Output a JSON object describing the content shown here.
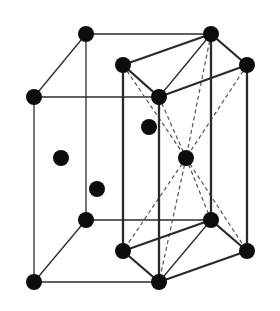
{
  "diagram": {
    "type": "crystal-unit-cell",
    "colors": {
      "background": "#ffffff",
      "line": "#2a2a2a",
      "atom": "#0d0d0d",
      "dashed": "#555555"
    },
    "atoms": [
      {
        "id": "a1",
        "x": 86,
        "y": 34
      },
      {
        "id": "a2",
        "x": 211,
        "y": 34
      },
      {
        "id": "a3",
        "x": 123,
        "y": 65
      },
      {
        "id": "a4",
        "x": 247,
        "y": 65
      },
      {
        "id": "a5",
        "x": 34,
        "y": 97
      },
      {
        "id": "a6",
        "x": 159,
        "y": 97
      },
      {
        "id": "a7",
        "x": 149,
        "y": 127
      },
      {
        "id": "a8",
        "x": 61,
        "y": 158
      },
      {
        "id": "a9",
        "x": 186,
        "y": 158
      },
      {
        "id": "a10",
        "x": 97,
        "y": 189
      },
      {
        "id": "a11",
        "x": 86,
        "y": 220
      },
      {
        "id": "a12",
        "x": 211,
        "y": 220
      },
      {
        "id": "a13",
        "x": 123,
        "y": 251
      },
      {
        "id": "a14",
        "x": 247,
        "y": 251
      },
      {
        "id": "a15",
        "x": 34,
        "y": 282
      },
      {
        "id": "a16",
        "x": 159,
        "y": 282
      }
    ],
    "thin_edges": [
      [
        86,
        34,
        211,
        34
      ],
      [
        34,
        97,
        86,
        34
      ],
      [
        34,
        97,
        159,
        97
      ],
      [
        34,
        97,
        34,
        282
      ],
      [
        86,
        34,
        86,
        220
      ],
      [
        86,
        220,
        211,
        220
      ],
      [
        34,
        282,
        86,
        220
      ],
      [
        34,
        282,
        159,
        282
      ],
      [
        211,
        34,
        159,
        97
      ],
      [
        211,
        220,
        159,
        282
      ]
    ],
    "thick_edges": [
      [
        123,
        65,
        211,
        34
      ],
      [
        211,
        34,
        247,
        65
      ],
      [
        247,
        65,
        159,
        97
      ],
      [
        159,
        97,
        123,
        65
      ],
      [
        123,
        251,
        211,
        220
      ],
      [
        211,
        220,
        247,
        251
      ],
      [
        247,
        251,
        159,
        282
      ],
      [
        159,
        282,
        123,
        251
      ],
      [
        123,
        65,
        123,
        251
      ],
      [
        159,
        97,
        159,
        282
      ],
      [
        211,
        34,
        211,
        220
      ],
      [
        247,
        65,
        247,
        251
      ]
    ],
    "dashed_edges": [
      [
        123,
        65,
        186,
        158
      ],
      [
        159,
        97,
        186,
        158
      ],
      [
        211,
        34,
        186,
        158
      ],
      [
        247,
        65,
        186,
        158
      ],
      [
        186,
        158,
        123,
        251
      ],
      [
        186,
        158,
        159,
        282
      ],
      [
        186,
        158,
        211,
        220
      ],
      [
        186,
        158,
        247,
        251
      ]
    ]
  }
}
